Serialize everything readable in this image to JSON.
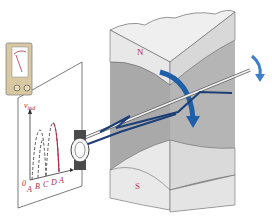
{
  "diagram": {
    "labels": {
      "north_pole": "N",
      "south_pole": "S",
      "y_axis": "v",
      "y_axis_sub": "ind",
      "origin": "0",
      "x_ticks": [
        "A",
        "B",
        "C",
        "D",
        "A"
      ]
    },
    "colors": {
      "pole_face": "#e6e6e6",
      "pole_side": "#a9a9a9",
      "pole_dark": "#9a9a9a",
      "arrow_blue": "#1f5fa8",
      "coil_blue": "#1d3f75",
      "label_red": "#b0304a",
      "meter_body": "#d9c9a3"
    }
  }
}
